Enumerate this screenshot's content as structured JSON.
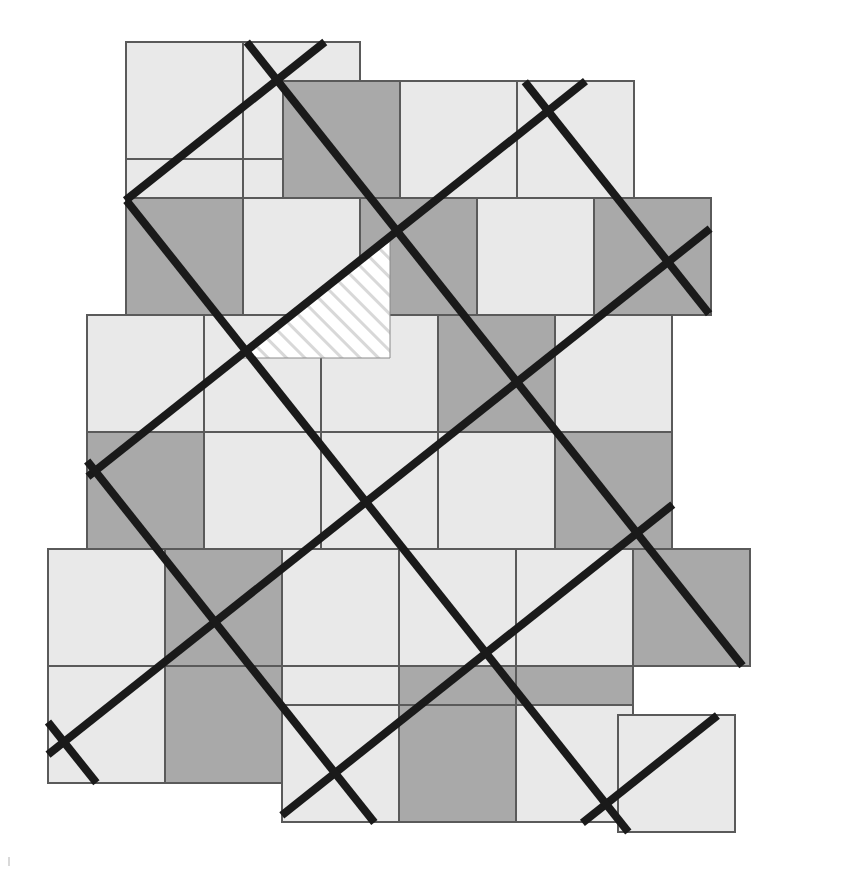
{
  "figure": {
    "canvas": {
      "width": 861,
      "height": 884,
      "background": "#ffffff"
    }
  },
  "palette": {
    "light_square": "#e9e9e9",
    "dark_square": "#a9a9a9",
    "line": "#1a1a1a",
    "outline": "#5a5a5a",
    "hatch_background": "#ffffff",
    "hatch_stroke": "#d8d8d8",
    "page_background": "#ffffff"
  },
  "geometry": {
    "checker_cell_size": 117,
    "checker_origin": {
      "x": 126,
      "y": 42
    },
    "lattice_pitch": 193,
    "lattice_rotation_deg": -38.5,
    "lattice_vector_u": {
      "dx": 151,
      "dy": -120
    },
    "lattice_vector_v": {
      "dx": 120,
      "dy": 151
    },
    "line_width": 8,
    "outline_width": 1.2
  },
  "hatch": {
    "label": "hatched-cell",
    "stroke_width": 5,
    "spacing": 13,
    "angle_deg": -45,
    "vertices": "bounded by the rotated lattice diagonal and the checker cell edges"
  },
  "squares": [
    {
      "id": "r0c0",
      "x": 126,
      "y": 42,
      "w": 117,
      "h": 117,
      "shade": "light"
    },
    {
      "id": "r0c1",
      "x": 243,
      "y": 42,
      "w": 117,
      "h": 117,
      "shade": "light"
    },
    {
      "id": "r1c0",
      "x": 126,
      "y": 159,
      "w": 117,
      "h": 117,
      "shade": "light"
    },
    {
      "id": "r1c1",
      "x": 243,
      "y": 159,
      "w": 117,
      "h": 117,
      "shade": "light"
    },
    {
      "id": "h0c1",
      "x": 283,
      "y": 81,
      "w": 117,
      "h": 117,
      "shade": "dark"
    },
    {
      "id": "h0c2",
      "x": 400,
      "y": 81,
      "w": 117,
      "h": 117,
      "shade": "light"
    },
    {
      "id": "h0c3",
      "x": 517,
      "y": 81,
      "w": 117,
      "h": 117,
      "shade": "light"
    },
    {
      "id": "h1c0",
      "x": 126,
      "y": 198,
      "w": 117,
      "h": 117,
      "shade": "dark"
    },
    {
      "id": "h1c1",
      "x": 243,
      "y": 198,
      "w": 117,
      "h": 117,
      "shade": "light"
    },
    {
      "id": "h1c2",
      "x": 360,
      "y": 198,
      "w": 117,
      "h": 117,
      "shade": "dark"
    },
    {
      "id": "h1c3",
      "x": 477,
      "y": 198,
      "w": 117,
      "h": 117,
      "shade": "light"
    },
    {
      "id": "h1c4",
      "x": 594,
      "y": 198,
      "w": 117,
      "h": 117,
      "shade": "dark"
    },
    {
      "id": "h2c0",
      "x": 87,
      "y": 315,
      "w": 117,
      "h": 117,
      "shade": "light"
    },
    {
      "id": "h2c1",
      "x": 204,
      "y": 315,
      "w": 117,
      "h": 117,
      "shade": "light"
    },
    {
      "id": "h2c2",
      "x": 321,
      "y": 315,
      "w": 117,
      "h": 117,
      "shade": "light"
    },
    {
      "id": "h2c3",
      "x": 438,
      "y": 315,
      "w": 117,
      "h": 117,
      "shade": "dark"
    },
    {
      "id": "h2c4",
      "x": 555,
      "y": 315,
      "w": 117,
      "h": 117,
      "shade": "light"
    },
    {
      "id": "h3c0",
      "x": 87,
      "y": 432,
      "w": 117,
      "h": 117,
      "shade": "dark"
    },
    {
      "id": "h3c1",
      "x": 204,
      "y": 432,
      "w": 117,
      "h": 117,
      "shade": "light"
    },
    {
      "id": "h3c2",
      "x": 321,
      "y": 432,
      "w": 117,
      "h": 117,
      "shade": "light"
    },
    {
      "id": "h3c3",
      "x": 438,
      "y": 432,
      "w": 117,
      "h": 117,
      "shade": "light"
    },
    {
      "id": "h3c4",
      "x": 555,
      "y": 432,
      "w": 117,
      "h": 117,
      "shade": "dark"
    },
    {
      "id": "h4c0",
      "x": 48,
      "y": 549,
      "w": 117,
      "h": 117,
      "shade": "light"
    },
    {
      "id": "h4c1",
      "x": 165,
      "y": 549,
      "w": 117,
      "h": 117,
      "shade": "dark"
    },
    {
      "id": "h4c2",
      "x": 282,
      "y": 549,
      "w": 117,
      "h": 117,
      "shade": "light"
    },
    {
      "id": "h4c3",
      "x": 399,
      "y": 549,
      "w": 117,
      "h": 117,
      "shade": "light"
    },
    {
      "id": "h4c4",
      "x": 516,
      "y": 549,
      "w": 117,
      "h": 117,
      "shade": "light"
    },
    {
      "id": "h4c5",
      "x": 633,
      "y": 549,
      "w": 117,
      "h": 117,
      "shade": "dark"
    },
    {
      "id": "h5c0",
      "x": 48,
      "y": 666,
      "w": 117,
      "h": 117,
      "shade": "light"
    },
    {
      "id": "h5c1",
      "x": 165,
      "y": 666,
      "w": 117,
      "h": 117,
      "shade": "dark"
    },
    {
      "id": "h5c2",
      "x": 282,
      "y": 666,
      "w": 117,
      "h": 117,
      "shade": "light"
    },
    {
      "id": "h5c3",
      "x": 399,
      "y": 666,
      "w": 117,
      "h": 117,
      "shade": "dark"
    },
    {
      "id": "h5c4",
      "x": 516,
      "y": 666,
      "w": 117,
      "h": 117,
      "shade": "dark"
    },
    {
      "id": "h6c2",
      "x": 282,
      "y": 705,
      "w": 117,
      "h": 117,
      "shade": "light"
    },
    {
      "id": "h6c3",
      "x": 399,
      "y": 705,
      "w": 117,
      "h": 117,
      "shade": "dark"
    },
    {
      "id": "h6c4",
      "x": 516,
      "y": 705,
      "w": 117,
      "h": 117,
      "shade": "light"
    },
    {
      "id": "h6c5",
      "x": 618,
      "y": 715,
      "w": 117,
      "h": 117,
      "shade": "light"
    }
  ],
  "lattice_nodes": [
    {
      "x": 277,
      "y": 80
    },
    {
      "x": 126,
      "y": 200
    },
    {
      "x": 390,
      "y": 241
    },
    {
      "x": 237,
      "y": 358
    },
    {
      "x": 547,
      "y": 122
    },
    {
      "x": 506,
      "y": 400
    },
    {
      "x": 353,
      "y": 519
    },
    {
      "x": 97,
      "y": 479
    },
    {
      "x": 663,
      "y": 281
    },
    {
      "x": 622,
      "y": 560
    },
    {
      "x": 469,
      "y": 678
    },
    {
      "x": 213,
      "y": 637
    },
    {
      "x": 48,
      "y": 758
    },
    {
      "x": 779,
      "y": 440
    },
    {
      "x": 735,
      "y": 718
    },
    {
      "x": 584,
      "y": 837
    },
    {
      "x": 329,
      "y": 796
    },
    {
      "x": 818,
      "y": 161
    }
  ],
  "notes": {
    "shade_legend_light": "light",
    "shade_legend_dark": "dark",
    "hatched_count": 1,
    "total_squares": 36
  }
}
